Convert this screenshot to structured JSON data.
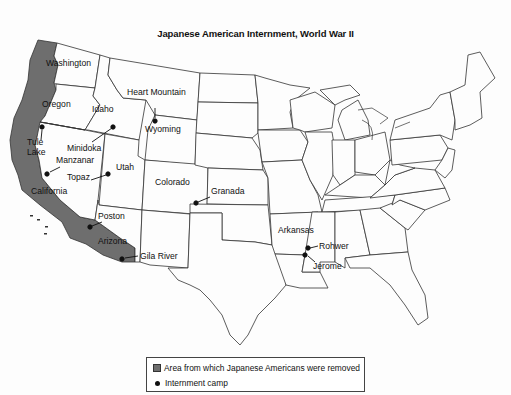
{
  "title": "Japanese American Internment, World War II",
  "colors": {
    "removed_area": "#6e6e6e",
    "state_fill": "#fdfdfd",
    "border": "#333333",
    "camp_dot": "#111111"
  },
  "states": [
    "Washington",
    "Oregon",
    "Idaho",
    "Wyoming",
    "Utah",
    "Colorado",
    "California",
    "Arizona",
    "Arkansas"
  ],
  "labels": {
    "washington": "Washington",
    "oregon": "Oregon",
    "idaho": "Idaho",
    "wyoming": "Wyoming",
    "utah": "Utah",
    "colorado": "Colorado",
    "california": "California",
    "arizona": "Arizona",
    "arkansas": "Arkansas"
  },
  "camps": {
    "heart_mountain": "Heart Mountain",
    "minidoka": "Minidoka",
    "tule_lake_1": "Tule",
    "tule_lake_2": "Lake",
    "manzanar": "Manzanar",
    "topaz": "Topaz",
    "granada": "Granada",
    "poston": "Poston",
    "gila_river": "Gila River",
    "rohwer": "Rohwer",
    "jerome": "Jerome"
  },
  "legend": {
    "removed_area": "Area from which Japanese Americans were removed",
    "camp": "Internment camp"
  }
}
